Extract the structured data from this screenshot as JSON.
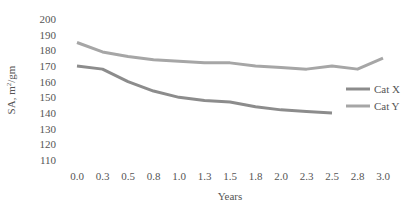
{
  "chart_data": {
    "type": "line",
    "title": "",
    "xlabel": "Years",
    "ylabel": "SA, m²/gm",
    "ylim": [
      110,
      200
    ],
    "yticks": [
      110,
      120,
      130,
      140,
      150,
      160,
      170,
      180,
      190,
      200
    ],
    "categories": [
      "0.0",
      "0.3",
      "0.5",
      "0.8",
      "1.0",
      "1.3",
      "1.5",
      "1.8",
      "2.0",
      "2.3",
      "2.5",
      "2.8",
      "3.0"
    ],
    "grid": false,
    "legend_position": "right",
    "series": [
      {
        "name": "Cat X",
        "color": "#8c8c8c",
        "values": [
          170,
          168,
          160,
          154,
          150,
          148,
          147,
          144,
          142,
          141,
          140,
          null,
          null
        ]
      },
      {
        "name": "Cat Y",
        "color": "#a6a6a6",
        "values": [
          185,
          179,
          176,
          174,
          173,
          172,
          172,
          170,
          169,
          168,
          170,
          168,
          175
        ]
      }
    ]
  }
}
